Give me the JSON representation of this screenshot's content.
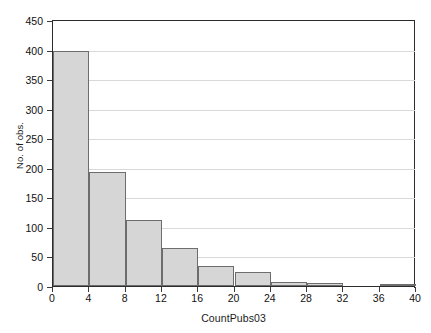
{
  "chart_data": {
    "type": "bar",
    "title": "",
    "subtitle": "",
    "xlabel": "CountPubs03",
    "ylabel": "No. of obs.",
    "xlim": [
      0,
      40
    ],
    "ylim": [
      0,
      450
    ],
    "grid": true,
    "legend": null,
    "x_ticks": [
      "0",
      "4",
      "8",
      "12",
      "16",
      "20",
      "24",
      "28",
      "32",
      "36",
      "40"
    ],
    "x_tick_values": [
      0,
      4,
      8,
      12,
      16,
      20,
      24,
      28,
      32,
      36,
      40
    ],
    "y_ticks": [
      "0",
      "50",
      "100",
      "150",
      "200",
      "250",
      "300",
      "350",
      "400",
      "450"
    ],
    "y_tick_values": [
      0,
      50,
      100,
      150,
      200,
      250,
      300,
      350,
      400,
      450
    ],
    "bin_width": 4,
    "bin_edges": [
      0,
      4,
      8,
      12,
      16,
      20,
      24,
      28,
      32,
      36,
      40
    ],
    "categories": [
      "0-4",
      "4-8",
      "8-12",
      "12-16",
      "16-20",
      "20-24",
      "24-28",
      "28-32",
      "32-36",
      "36-40"
    ],
    "values": [
      398,
      193,
      112,
      64,
      34,
      24,
      7,
      5,
      0,
      2
    ],
    "bar_fill_color": "#d6d6d6",
    "bar_edge_color": "#6d6d6d",
    "gridline_color": "#d9d9d9",
    "axis_color": "#2b2b2b"
  }
}
